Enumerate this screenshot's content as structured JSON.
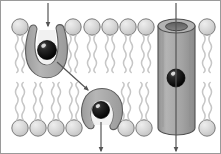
{
  "figure": {
    "width": 221,
    "height": 154,
    "background_color": "#ffffff",
    "frame": {
      "stroke_color": "#9a9a9a",
      "stroke_width": 1,
      "visible": true
    }
  },
  "palette": {
    "lipid_head_fill": "#d2d2d2",
    "lipid_head_highlight": "#e8e8e8",
    "lipid_head_stroke": "#6f6f6f",
    "lipid_tail_stroke": "#c9c9c9",
    "protein_fill": "#a8a8a8",
    "protein_fill_light": "#bdbdbd",
    "protein_cavity_fill": "#f1f1f1",
    "protein_stroke": "#5e5e5e",
    "channel_fill": "#a5a5a5",
    "channel_fill_shade": "#8e8e8e",
    "channel_pore_fill": "#6d6d6d",
    "channel_stroke": "#4f4f4f",
    "molecule_fill": "#131313",
    "molecule_highlight": "#f5f5f5",
    "molecule_stroke": "#000000",
    "arrow_color": "#555555"
  },
  "membrane": {
    "label": "phospholipid bilayer",
    "upper_leaflet": {
      "label": "outer leaflet",
      "head_center_y": 27,
      "head_radius": 8.5,
      "tail_start_y": 35,
      "tail_end_y": 70,
      "head_x_positions": [
        20,
        73,
        92,
        110,
        128,
        146,
        207
      ]
    },
    "lower_leaflet": {
      "label": "inner leaflet",
      "head_center_y": 128,
      "head_radius": 8.5,
      "tail_start_y": 120,
      "tail_end_y": 85,
      "head_x_positions": [
        20,
        38,
        56,
        74,
        126,
        144,
        207
      ]
    }
  },
  "proteins": [
    {
      "name": "carrier-protein-open-outward",
      "type": "carrier",
      "state": "open to exterior",
      "center_x": 46,
      "center_y": 55,
      "cargo": {
        "name": "transported-molecule",
        "cx": 47,
        "cy": 50,
        "r": 9.5
      }
    },
    {
      "name": "carrier-protein-open-inward",
      "type": "carrier",
      "state": "open to interior, releasing molecule",
      "center_x": 101,
      "center_y": 108,
      "cargo": {
        "name": "transported-molecule",
        "cx": 101,
        "cy": 110,
        "r": 8.5
      }
    },
    {
      "name": "channel-protein",
      "type": "channel",
      "state": "open pore",
      "center_x": 176,
      "top_y": 22,
      "bottom_y": 134,
      "width": 37,
      "cargo": {
        "name": "transported-molecule",
        "cx": 176,
        "cy": 78,
        "r": 9
      }
    }
  ],
  "arrows": [
    {
      "name": "entry-arrow-carrier",
      "description": "molecule entering carrier protein from outside",
      "x1": 48,
      "y1": 3,
      "x2": 48,
      "y2": 26,
      "head": "down"
    },
    {
      "name": "conformational-change-arrow",
      "description": "carrier protein conformational change from outward-open to inward-open",
      "x1": 57,
      "y1": 62,
      "x2": 88,
      "y2": 90,
      "head": "diagonal-down-right"
    },
    {
      "name": "exit-arrow-carrier",
      "description": "molecule released into cell interior",
      "x1": 101,
      "y1": 122,
      "x2": 101,
      "y2": 151,
      "head": "down"
    },
    {
      "name": "channel-flow-arrow",
      "description": "molecule passing straight through the channel protein",
      "x1": 176,
      "y1": 3,
      "x2": 176,
      "y2": 151,
      "head": "down"
    }
  ]
}
